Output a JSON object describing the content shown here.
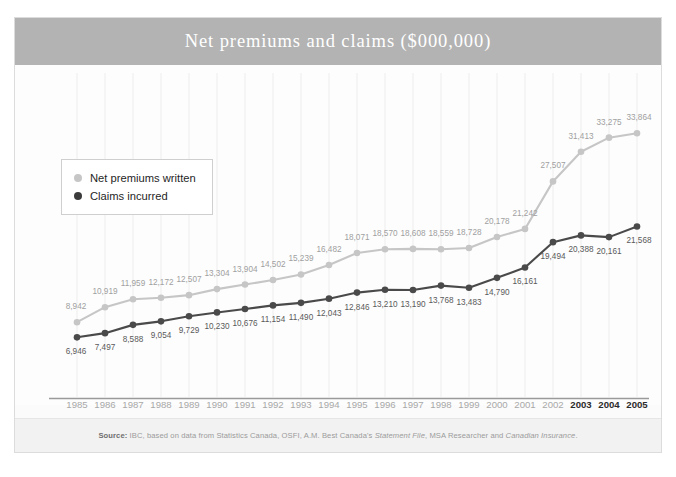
{
  "figure": {
    "title": "Net premiums and claims ($000,000)",
    "source_prefix": "Source:",
    "source_body": " IBC, based on data from Statistics Canada, OSFI, A.M. Best Canada's ",
    "source_italic_1": "Statement File",
    "source_mid": ", MSA Researcher and ",
    "source_italic_2": "Canadian Insurance",
    "source_end": "."
  },
  "legend": {
    "position": "top-left-inside",
    "items": [
      {
        "label": "Net premiums written",
        "color": "#c6c6c6"
      },
      {
        "label": "Claims incurred",
        "color": "#3b3b3b"
      }
    ]
  },
  "colors": {
    "title_band": "#b3b3b3",
    "series_premiums": "#c6c6c6",
    "series_claims": "#4a4a4a",
    "axis": "#9a9a9a",
    "grid": "#ededed",
    "label_muted": "#a8a8a8",
    "label_bold": "#2b2b2b"
  },
  "chart_data": {
    "type": "line",
    "title": "Net premiums and claims ($000,000)",
    "xlabel": "",
    "ylabel": "",
    "ylim": [
      0,
      36000
    ],
    "grid": true,
    "legend_position": "top-left-inside",
    "categories": [
      "1985",
      "1986",
      "1987",
      "1988",
      "1989",
      "1990",
      "1991",
      "1992",
      "1993",
      "1994",
      "1995",
      "1996",
      "1997",
      "1998",
      "1999",
      "2000",
      "2001",
      "2002",
      "2003",
      "2004",
      "2005"
    ],
    "highlighted_categories": [
      "2003",
      "2004",
      "2005"
    ],
    "series": [
      {
        "name": "Net premiums written",
        "color": "#c6c6c6",
        "values": [
          8942,
          10919,
          11959,
          12172,
          12507,
          13304,
          13904,
          14502,
          15239,
          16482,
          18071,
          18570,
          18608,
          18559,
          18728,
          20178,
          21242,
          27507,
          31413,
          33275,
          33864
        ],
        "labels": [
          "8,942",
          "10,919",
          "11,959",
          "12,172",
          "12,507",
          "13,304",
          "13,904",
          "14,502",
          "15,239",
          "16,482",
          "18,071",
          "18,570",
          "18,608",
          "18,559",
          "18,728",
          "20,178",
          "21,242",
          "27,507",
          "31,413",
          "33,275",
          "33,864"
        ]
      },
      {
        "name": "Claims incurred",
        "color": "#4a4a4a",
        "values": [
          6946,
          7497,
          8588,
          9054,
          9729,
          10230,
          10676,
          11154,
          11490,
          12043,
          12846,
          13210,
          13190,
          13768,
          13483,
          14790,
          16161,
          19494,
          20388,
          20161,
          21568
        ],
        "labels": [
          "6,946",
          "7,497",
          "8,588",
          "9,054",
          "9,729",
          "10,230",
          "10,676",
          "11,154",
          "11,490",
          "12,043",
          "12,846",
          "13,210",
          "13,190",
          "13,768",
          "13,483",
          "14,790",
          "16,161",
          "19,494",
          "20,388",
          "20,161",
          "21,568"
        ]
      }
    ]
  }
}
